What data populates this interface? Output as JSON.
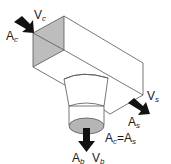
{
  "diagram": {
    "inlet": {
      "area": "A",
      "area_sub": "c",
      "velocity": "V",
      "velocity_sub": "c"
    },
    "straight_outlet": {
      "area": "A",
      "area_sub": "s",
      "velocity": "V",
      "velocity_sub": "s"
    },
    "branch_outlet": {
      "area": "A",
      "area_sub": "b",
      "velocity": "V",
      "velocity_sub": "b"
    },
    "equation": {
      "lhs": "A",
      "lhs_sub": "c",
      "eq": "=",
      "rhs": "A",
      "rhs_sub": "s"
    },
    "colors": {
      "line": "#555555",
      "shade": "#bdbdbd",
      "arrow": "#111111",
      "ellipse": "#b5b5b5"
    }
  }
}
